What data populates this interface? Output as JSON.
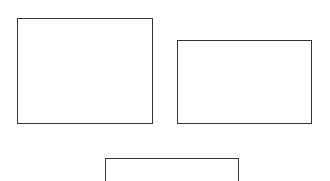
{
  "canvas": {
    "width": 330,
    "height": 181,
    "background": "#ffffff"
  },
  "style": {
    "border_color": "#333333",
    "fill_color": "#ffffff"
  },
  "boxes": [
    {
      "id": "box-1",
      "label": "",
      "x": 17,
      "y": 18,
      "width": 136,
      "height": 106
    },
    {
      "id": "box-2",
      "label": "",
      "x": 177,
      "y": 40,
      "width": 135,
      "height": 84
    },
    {
      "id": "box-3",
      "label": "",
      "x": 105,
      "y": 158,
      "width": 134,
      "height": 40
    }
  ]
}
